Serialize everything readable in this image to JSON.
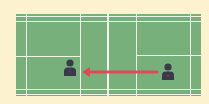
{
  "diagram": {
    "type": "badminton-court",
    "colors": {
      "background": "#fcf2cf",
      "court": "#77b07a",
      "lines": "#eef5e8",
      "player": "#3b3a4a",
      "player_accent": "#5a3a6a",
      "arrow": "#e0495a"
    },
    "players": [
      {
        "id": "left-player",
        "x": 70,
        "y": 70
      },
      {
        "id": "right-player",
        "x": 168,
        "y": 73
      }
    ],
    "arrow": {
      "from": "right-player",
      "to": "left-player",
      "direction": "left"
    }
  }
}
